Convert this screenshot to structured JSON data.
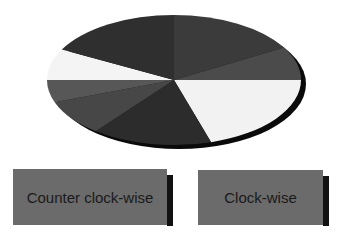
{
  "pie": {
    "center": [
      174,
      80
    ],
    "rx": 127,
    "ry": 65,
    "shadow_offset": [
      5,
      4
    ],
    "shadow_color": "#0a0a0a",
    "segments": [
      {
        "name": "segment-1",
        "start": 0,
        "end": 73,
        "color": "#f2f2f2"
      },
      {
        "name": "segment-2",
        "start": 73,
        "end": 128,
        "color": "#2c2c2c"
      },
      {
        "name": "segment-3",
        "start": 128,
        "end": 160,
        "color": "#474747"
      },
      {
        "name": "segment-4",
        "start": 160,
        "end": 180,
        "color": "#575757"
      },
      {
        "name": "segment-5",
        "start": 180,
        "end": 208,
        "color": "#f4f4f4"
      },
      {
        "name": "segment-6",
        "start": 208,
        "end": 270,
        "color": "#2f2f2f"
      },
      {
        "name": "segment-7",
        "start": 270,
        "end": 330,
        "color": "#3b3b3b"
      },
      {
        "name": "segment-8",
        "start": 330,
        "end": 360,
        "color": "#4b4b4b"
      }
    ]
  },
  "buttons": {
    "counter_clockwise": {
      "label": "Counter clock-wise"
    },
    "clockwise": {
      "label": "Clock-wise"
    }
  }
}
